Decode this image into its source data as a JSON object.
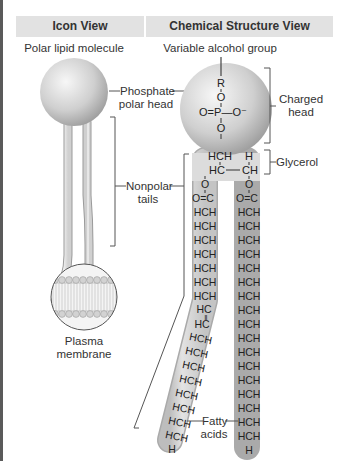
{
  "headers": {
    "icon_view": "Icon View",
    "chemical_view": "Chemical Structure View"
  },
  "icon_view": {
    "title": "Polar lipid molecule",
    "phosphate_label_line1": "Phosphate",
    "phosphate_label_line2": "polar head",
    "nonpolar_label_line1": "Nonpolar",
    "nonpolar_label_line2": "tails",
    "membrane_label_line1": "Plasma",
    "membrane_label_line2": "membrane"
  },
  "chemical_view": {
    "title": "Variable alcohol group",
    "charged_label_line1": "Charged",
    "charged_label_line2": "head",
    "glycerol_label": "Glycerol",
    "fatty_label_line1": "Fatty",
    "fatty_label_line2": "acids",
    "head_atoms": {
      "r": "R",
      "o1": "O",
      "phosphate": "O=P—O⁻",
      "o2": "O"
    },
    "glycerol_rows": [
      "HCH",
      "H",
      "HC",
      "CH"
    ],
    "ester_o": "O",
    "ester_c": "O=C",
    "chain_unit": "HCH",
    "double_bond_unit": "HC",
    "chain_end": "H"
  },
  "colors": {
    "header_bg": "#e2e2e2",
    "sphere_light": "#f4f4f4",
    "sphere_dark": "#a9a9a9",
    "tube_fill": "#d9d9d9",
    "line": "#444444"
  }
}
